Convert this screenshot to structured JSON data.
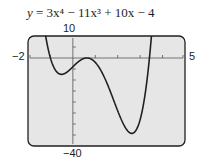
{
  "chart_data": {
    "type": "line",
    "equation": {
      "a4": 3,
      "a3": -11,
      "a2": 0,
      "a1": 10,
      "a0": -4
    },
    "xlim": [
      -2,
      5
    ],
    "ylim": [
      -40,
      10
    ],
    "xticks": [
      -1,
      0,
      1,
      2,
      3,
      4
    ],
    "yticks": [
      10,
      5,
      0,
      -5,
      -10,
      -15,
      -20,
      -25,
      -30,
      -35,
      -40
    ],
    "tick_labels": {
      "xmin": "−2",
      "xmax": "5",
      "ymax": "10",
      "ymin": "−40"
    },
    "grid": false,
    "background": "#e6e6e6",
    "line_color": "#231f20",
    "x": [
      -0.9,
      -0.6,
      -0.3,
      0,
      0.3,
      0.6,
      1,
      1.5,
      2,
      2.5,
      2.75,
      3,
      3.3,
      3.6
    ],
    "y": [
      9.7,
      -6.7,
      -6.9,
      -4,
      -1.1,
      -0.9,
      -2,
      -13.9,
      -28,
      -36.2,
      -35.9,
      -31,
      -16.2,
      9.9
    ],
    "features": {
      "local_min_1": [
        -0.45,
        -7.2
      ],
      "local_max": [
        0.5,
        -0.6
      ],
      "local_min_2": [
        2.6,
        -36.8
      ]
    }
  },
  "header": {
    "title_prefix": "y",
    "title_rest": " = 3x⁴ − 11x³ + 10x − 4"
  },
  "labels": {
    "ymax": "10",
    "ymin": "−40",
    "xmin": "−2",
    "xmax": "5"
  }
}
